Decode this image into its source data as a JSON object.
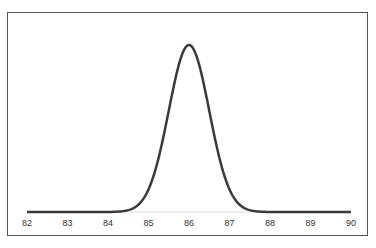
{
  "chart_data": {
    "type": "line",
    "title": "",
    "xlabel": "",
    "ylabel": "",
    "x_ticks": [
      "82",
      "83",
      "84",
      "85",
      "86",
      "87",
      "88",
      "89",
      "90"
    ],
    "xlim": [
      82,
      90
    ],
    "distribution": {
      "kind": "normal",
      "mean": 86,
      "std": 0.5
    },
    "series": [
      {
        "name": "density",
        "x": [
          82,
          83,
          84,
          84.5,
          85,
          85.25,
          85.5,
          85.75,
          86,
          86.25,
          86.5,
          86.75,
          87,
          87.5,
          88,
          89,
          90
        ],
        "y": [
          0,
          0,
          0,
          0.011,
          0.054,
          0.26,
          0.48,
          0.7,
          0.8,
          0.7,
          0.48,
          0.26,
          0.108,
          0.011,
          0,
          0,
          0
        ]
      }
    ],
    "grid": false,
    "legend": "none"
  }
}
